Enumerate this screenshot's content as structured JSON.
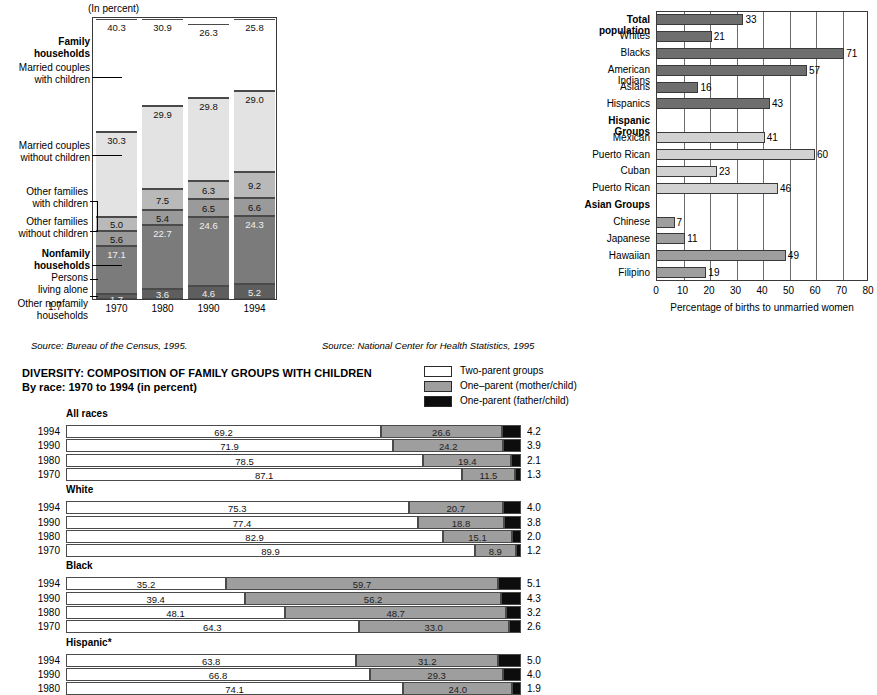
{
  "colors": {
    "white": "#ffffff",
    "light_gray": "#e3e3e3",
    "mid_gray": "#b9b9b9",
    "dark_gray": "#8e8e8e",
    "darker_gray": "#7b7b7b",
    "charcoal": "#6e6e6e",
    "near_black": "#3b3b3b",
    "black": "#0d0d0d",
    "rule": "#3a3a3a"
  },
  "left_panel": {
    "unit_note": "(In percent)",
    "source": "Source: Bureau of the Census, 1995.",
    "side_labels": [
      {
        "lines": [
          "Family",
          "households"
        ],
        "bold": true
      },
      {
        "lines": [
          "Married couples",
          "with children"
        ],
        "bold": false
      },
      {
        "lines": [
          "Married couples",
          "without children"
        ],
        "bold": false
      },
      {
        "lines": [
          "Other families",
          "with children"
        ],
        "bold": false
      },
      {
        "lines": [
          "Other families",
          "without children"
        ],
        "bold": false
      },
      {
        "lines": [
          "Nonfamily",
          "households"
        ],
        "bold": true
      },
      {
        "lines": [
          "Persons",
          "living alone"
        ],
        "bold": false
      },
      {
        "lines": [
          "Other nonfamily",
          "households"
        ],
        "bold": false
      }
    ],
    "footnote_value": "1.7",
    "chart_data": {
      "type": "bar",
      "stacked": true,
      "title": "Household composition",
      "xlabel": "",
      "ylabel": "(In percent)",
      "ylim": [
        0,
        100
      ],
      "grid": false,
      "categories": [
        "1970",
        "1980",
        "1990",
        "1994"
      ],
      "series": [
        {
          "name": "Married couples with children",
          "color": "#ffffff",
          "values": [
            40.3,
            30.9,
            26.3,
            25.8
          ]
        },
        {
          "name": "Married couples without children",
          "color": "#e3e3e3",
          "values": [
            30.3,
            29.9,
            29.8,
            29.0
          ]
        },
        {
          "name": "Other families with children",
          "color": "#b9b9b9",
          "values": [
            5.0,
            7.5,
            6.3,
            9.2
          ]
        },
        {
          "name": "Other families without children",
          "color": "#9a9a9a",
          "values": [
            5.6,
            5.4,
            6.5,
            6.6
          ]
        },
        {
          "name": "Persons living alone",
          "color": "#7b7b7b",
          "values": [
            17.1,
            22.7,
            24.6,
            24.3
          ]
        },
        {
          "name": "Other nonfamily households",
          "color": "#5e5e5e",
          "values": [
            1.7,
            3.6,
            4.6,
            5.2
          ]
        }
      ]
    }
  },
  "right_panel": {
    "source": "Source: National Center for Health Statistics, 1995",
    "chart_data": {
      "type": "bar",
      "orientation": "horizontal",
      "title": "",
      "xlabel": "Percentage of births to unmarried women",
      "ylabel": "",
      "xlim": [
        0,
        80
      ],
      "xticks": [
        0,
        10,
        20,
        30,
        40,
        50,
        60,
        70,
        80
      ],
      "grid": true,
      "rows": [
        {
          "label": "Total population",
          "bold": true,
          "value": 33,
          "color": "#6e6e6e"
        },
        {
          "label": "Whites",
          "bold": false,
          "value": 21,
          "color": "#6e6e6e"
        },
        {
          "label": "Blacks",
          "bold": false,
          "value": 71,
          "color": "#6e6e6e"
        },
        {
          "label": "American Indians",
          "bold": false,
          "value": 57,
          "color": "#6e6e6e"
        },
        {
          "label": "Asians",
          "bold": false,
          "value": 16,
          "color": "#6e6e6e"
        },
        {
          "label": "Hispanics",
          "bold": false,
          "value": 43,
          "color": "#6e6e6e"
        },
        {
          "label": "Hispanic Groups",
          "bold": true,
          "value": null,
          "color": null
        },
        {
          "label": "Mexican",
          "bold": false,
          "value": 41,
          "color": "#d2d2d2"
        },
        {
          "label": "Puerto Rican",
          "bold": false,
          "value": 60,
          "color": "#d2d2d2"
        },
        {
          "label": "Cuban",
          "bold": false,
          "value": 23,
          "color": "#d2d2d2"
        },
        {
          "label": "Puerto Rican",
          "bold": false,
          "value": 46,
          "color": "#d2d2d2"
        },
        {
          "label": "Asian Groups",
          "bold": true,
          "value": null,
          "color": null
        },
        {
          "label": "Chinese",
          "bold": false,
          "value": 7,
          "color": "#9e9e9e"
        },
        {
          "label": "Japanese",
          "bold": false,
          "value": 11,
          "color": "#9e9e9e"
        },
        {
          "label": "Hawaiian",
          "bold": false,
          "value": 49,
          "color": "#9e9e9e"
        },
        {
          "label": "Filipino",
          "bold": false,
          "value": 19,
          "color": "#9e9e9e"
        }
      ]
    }
  },
  "bottom_panel": {
    "title_line1": "DIVERSITY: COMPOSITION OF FAMILY GROUPS WITH CHILDREN",
    "title_line2": "By race: 1970 to 1994 (in percent)",
    "legend": [
      {
        "label": "Two-parent groups",
        "color": "#ffffff"
      },
      {
        "label": "One–parent (mother/child)",
        "color": "#9e9e9e"
      },
      {
        "label": "One-parent (father/child)",
        "color": "#0d0d0d"
      }
    ],
    "chart_data": {
      "type": "bar",
      "stacked": true,
      "orientation": "horizontal",
      "title": "DIVERSITY: COMPOSITION OF FAMILY GROUPS WITH CHILDREN",
      "subtitle": "By race: 1970 to 1994 (in percent)",
      "xlim": [
        0,
        100
      ],
      "series_names": [
        "Two-parent groups",
        "One–parent (mother/child)",
        "One-parent (father/child)"
      ],
      "groups": [
        {
          "name": "All races",
          "rows": [
            {
              "year": "1994",
              "two_parent": 69.2,
              "mother": 26.6,
              "father": 4.2
            },
            {
              "year": "1990",
              "two_parent": 71.9,
              "mother": 24.2,
              "father": 3.9
            },
            {
              "year": "1980",
              "two_parent": 78.5,
              "mother": 19.4,
              "father": 2.1
            },
            {
              "year": "1970",
              "two_parent": 87.1,
              "mother": 11.5,
              "father": 1.3
            }
          ]
        },
        {
          "name": "White",
          "rows": [
            {
              "year": "1994",
              "two_parent": 75.3,
              "mother": 20.7,
              "father": 4.0
            },
            {
              "year": "1990",
              "two_parent": 77.4,
              "mother": 18.8,
              "father": 3.8
            },
            {
              "year": "1980",
              "two_parent": 82.9,
              "mother": 15.1,
              "father": 2.0
            },
            {
              "year": "1970",
              "two_parent": 89.9,
              "mother": 8.9,
              "father": 1.2
            }
          ]
        },
        {
          "name": "Black",
          "rows": [
            {
              "year": "1994",
              "two_parent": 35.2,
              "mother": 59.7,
              "father": 5.1
            },
            {
              "year": "1990",
              "two_parent": 39.4,
              "mother": 56.2,
              "father": 4.3
            },
            {
              "year": "1980",
              "two_parent": 48.1,
              "mother": 48.7,
              "father": 3.2
            },
            {
              "year": "1970",
              "two_parent": 64.3,
              "mother": 33.0,
              "father": 2.6
            }
          ]
        },
        {
          "name": "Hispanic*",
          "rows": [
            {
              "year": "1994",
              "two_parent": 63.8,
              "mother": 31.2,
              "father": 5.0
            },
            {
              "year": "1990",
              "two_parent": 66.8,
              "mother": 29.3,
              "father": 4.0
            },
            {
              "year": "1980",
              "two_parent": 74.1,
              "mother": 24.0,
              "father": 1.9
            }
          ]
        }
      ]
    }
  }
}
